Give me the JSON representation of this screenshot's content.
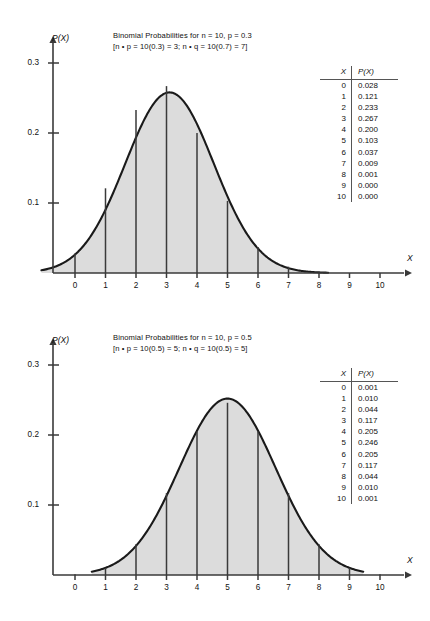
{
  "figure": {
    "panels": [
      {
        "id": "panel-0",
        "title_line1": "Binomial Probabilities for n = 10, p = 0.3",
        "title_line2": "[n • p = 10(0.3) = 3; n • q = 10(0.7) = 7]",
        "y_axis_label": "P(X)",
        "x_axis_label": "X",
        "table": {
          "header_x": "X",
          "header_p": "P(X)",
          "rows": [
            {
              "x": "0",
              "p": "0.028"
            },
            {
              "x": "1",
              "p": "0.121"
            },
            {
              "x": "2",
              "p": "0.233"
            },
            {
              "x": "3",
              "p": "0.267"
            },
            {
              "x": "4",
              "p": "0.200"
            },
            {
              "x": "5",
              "p": "0.103"
            },
            {
              "x": "6",
              "p": "0.037"
            },
            {
              "x": "7",
              "p": "0.009"
            },
            {
              "x": "8",
              "p": "0.001"
            },
            {
              "x": "9",
              "p": "0.000"
            },
            {
              "x": "10",
              "p": "0.000"
            }
          ]
        }
      },
      {
        "id": "panel-1",
        "title_line1": "Binomial Probabilities for n = 10, p = 0.5",
        "title_line2": "[n • p = 10(0.5) = 5; n • q = 10(0.5) = 5]",
        "y_axis_label": "P(X)",
        "x_axis_label": "X",
        "table": {
          "header_x": "X",
          "header_p": "P(X)",
          "rows": [
            {
              "x": "0",
              "p": "0.001"
            },
            {
              "x": "1",
              "p": "0.010"
            },
            {
              "x": "2",
              "p": "0.044"
            },
            {
              "x": "3",
              "p": "0.117"
            },
            {
              "x": "4",
              "p": "0.205"
            },
            {
              "x": "5",
              "p": "0.246"
            },
            {
              "x": "6",
              "p": "0.205"
            },
            {
              "x": "7",
              "p": "0.117"
            },
            {
              "x": "8",
              "p": "0.044"
            },
            {
              "x": "9",
              "p": "0.010"
            },
            {
              "x": "10",
              "p": "0.001"
            }
          ]
        }
      }
    ]
  },
  "chart_data": [
    {
      "type": "bar",
      "title": "Binomial Probabilities for n = 10, p = 0.3",
      "subtitle": "[n • p = 10(0.3) = 3; n • q = 10(0.7) = 7]",
      "xlabel": "X",
      "ylabel": "P(X)",
      "categories": [
        "0",
        "1",
        "2",
        "3",
        "4",
        "5",
        "6",
        "7",
        "8",
        "9",
        "10"
      ],
      "values": [
        0.028,
        0.121,
        0.233,
        0.267,
        0.2,
        0.103,
        0.037,
        0.009,
        0.001,
        0.0,
        0.0
      ],
      "xlim": [
        0,
        10
      ],
      "ylim": [
        0,
        0.32
      ],
      "ytick_labels": [
        "0.1",
        "0.2",
        "0.3"
      ],
      "ytick_values": [
        0.1,
        0.2,
        0.3
      ],
      "xtick_labels": [
        "0",
        "1",
        "2",
        "3",
        "4",
        "5",
        "6",
        "7",
        "8",
        "9",
        "10"
      ],
      "grid": false,
      "legend": "none",
      "overlay": {
        "type": "line",
        "name": "normal approximation curve",
        "mean": 3.1,
        "sigma": 1.45,
        "peak_value": 0.258,
        "fill": true,
        "fill_color": "#dcdcdc",
        "line_color": "#1a1a1a",
        "x_start": -1.1,
        "x_end": 8.3
      },
      "n": 10,
      "p": 0.3,
      "q": 0.7,
      "mean_np": 3,
      "mean_nq": 7
    },
    {
      "type": "bar",
      "title": "Binomial Probabilities for n = 10, p = 0.5",
      "subtitle": "[n • p = 10(0.5) = 5; n • q = 10(0.5) = 5]",
      "xlabel": "X",
      "ylabel": "P(X)",
      "categories": [
        "0",
        "1",
        "2",
        "3",
        "4",
        "5",
        "6",
        "7",
        "8",
        "9",
        "10"
      ],
      "values": [
        0.001,
        0.01,
        0.044,
        0.117,
        0.205,
        0.246,
        0.205,
        0.117,
        0.044,
        0.01,
        0.001
      ],
      "xlim": [
        0,
        10
      ],
      "ylim": [
        0,
        0.32
      ],
      "ytick_labels": [
        "0.1",
        "0.2",
        "0.3"
      ],
      "ytick_values": [
        0.1,
        0.2,
        0.3
      ],
      "xtick_labels": [
        "0",
        "1",
        "2",
        "3",
        "4",
        "5",
        "6",
        "7",
        "8",
        "9",
        "10"
      ],
      "grid": false,
      "legend": "none",
      "overlay": {
        "type": "line",
        "name": "normal approximation curve",
        "mean": 5.0,
        "sigma": 1.58,
        "peak_value": 0.252,
        "fill": true,
        "fill_color": "#dcdcdc",
        "line_color": "#1a1a1a",
        "x_start": 0.55,
        "x_end": 9.45
      },
      "n": 10,
      "p": 0.5,
      "q": 0.5,
      "mean_np": 5,
      "mean_nq": 5
    }
  ],
  "colors": {
    "curve_fill": "#dcdcdc",
    "curve_line": "#1a1a1a",
    "axis": "#3a3a3a",
    "bar_line": "#3a3a3a",
    "text": "#111111"
  }
}
